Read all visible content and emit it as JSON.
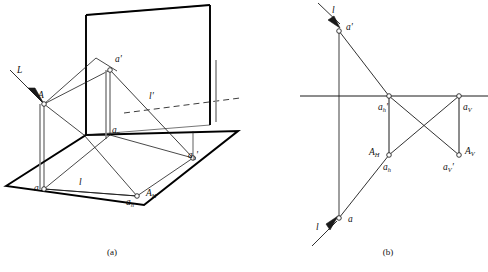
{
  "figure": {
    "background_color": "#ffffff",
    "line_color": "#1a1a1a",
    "thick_edge_color": "#000000",
    "panels": [
      {
        "id": "a",
        "caption": "(a)",
        "description": "Pictorial (axonometric) view with horizontal plane H and vertical plane V",
        "labels": [
          {
            "key": "L",
            "base": "L",
            "sub": "",
            "prime": "",
            "x": 17,
            "y": 73
          },
          {
            "key": "A",
            "base": "A",
            "sub": "",
            "prime": "",
            "x": 38,
            "y": 98
          },
          {
            "key": "a_prime",
            "base": "a",
            "sub": "",
            "prime": "'",
            "x": 115,
            "y": 62
          },
          {
            "key": "l_prime",
            "base": "l",
            "sub": "",
            "prime": "'",
            "x": 149,
            "y": 99
          },
          {
            "key": "a_x",
            "base": "a",
            "sub": "x",
            "prime": "",
            "x": 112,
            "y": 133
          },
          {
            "key": "a_h_prime",
            "base": "a",
            "sub": "h",
            "prime": "'",
            "x": 188,
            "y": 158
          },
          {
            "key": "a",
            "base": "a",
            "sub": "",
            "prime": "",
            "x": 34,
            "y": 191
          },
          {
            "key": "l",
            "base": "l",
            "sub": "",
            "prime": "",
            "x": 79,
            "y": 185
          },
          {
            "key": "a_h",
            "base": "a",
            "sub": "h",
            "prime": "",
            "x": 126,
            "y": 205
          },
          {
            "key": "A_H",
            "base": "A",
            "sub": "H",
            "prime": "",
            "x": 146,
            "y": 196
          }
        ]
      },
      {
        "id": "b",
        "caption": "(b)",
        "description": "Orthographic two-view projection drawing with XY ground line",
        "labels": [
          {
            "key": "l_top",
            "base": "l",
            "sub": "",
            "prime": "",
            "x": 332,
            "y": 13
          },
          {
            "key": "a_prime",
            "base": "a",
            "sub": "",
            "prime": "'",
            "x": 348,
            "y": 30
          },
          {
            "key": "a_h_prime",
            "base": "a",
            "sub": "h",
            "prime": "'",
            "x": 385,
            "y": 105
          },
          {
            "key": "a_V",
            "base": "a",
            "sub": "V",
            "prime": "",
            "x": 470,
            "y": 105
          },
          {
            "key": "A_H",
            "base": "A",
            "sub": "H",
            "prime": "",
            "x": 381,
            "y": 157
          },
          {
            "key": "a_h",
            "base": "a",
            "sub": "h",
            "prime": "",
            "x": 399,
            "y": 172
          },
          {
            "key": "a_V_prime",
            "base": "a",
            "sub": "V",
            "prime": "'",
            "x": 455,
            "y": 172
          },
          {
            "key": "A_V",
            "base": "A",
            "sub": "V",
            "prime": "",
            "x": 472,
            "y": 157
          },
          {
            "key": "a",
            "base": "a",
            "sub": "",
            "prime": "",
            "x": 349,
            "y": 221
          },
          {
            "key": "l_bottom",
            "base": "l",
            "sub": "",
            "prime": "",
            "x": 319,
            "y": 228
          }
        ]
      }
    ],
    "captions": {
      "panel_a": "(a)",
      "panel_b": "(b)"
    }
  }
}
